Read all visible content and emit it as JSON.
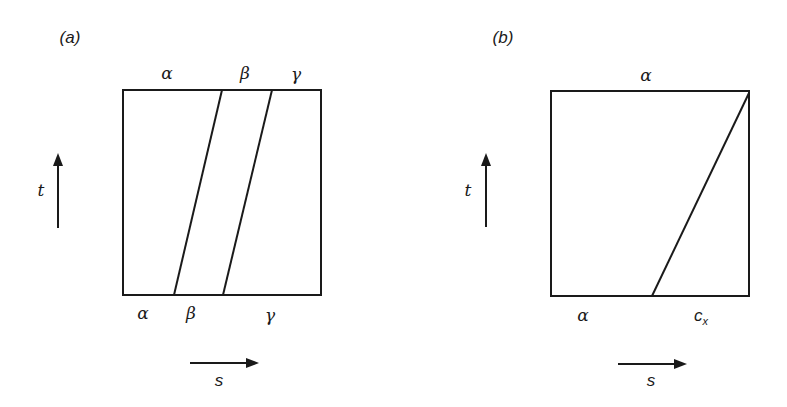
{
  "panels": [
    {
      "id": "a",
      "label": "(a)",
      "top_labels": [
        "α",
        "β",
        "γ"
      ],
      "bottom_labels": [
        "α",
        "β",
        "γ"
      ],
      "vertical_axis": "t",
      "horizontal_axis": "s",
      "boundaries": [
        {
          "bottom_x": 174,
          "top_x": 222
        },
        {
          "bottom_x": 223,
          "top_x": 272
        }
      ]
    },
    {
      "id": "b",
      "label": "(b)",
      "top_labels": [
        "α"
      ],
      "bottom_labels": [
        "α",
        "c",
        "x"
      ],
      "vertical_axis": "t",
      "horizontal_axis": "s",
      "boundaries": [
        {
          "bottom_x": 652,
          "top_x": 749
        }
      ]
    }
  ],
  "colors": {
    "line": "#1a1a1a",
    "background": "#ffffff"
  }
}
